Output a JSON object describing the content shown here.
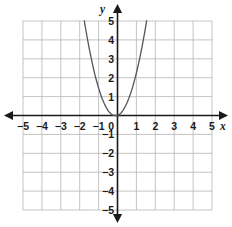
{
  "chart_data": {
    "type": "line",
    "title": "",
    "subtitle": "",
    "xlabel": "x",
    "ylabel": "y",
    "xlim": [
      -5,
      5
    ],
    "ylim": [
      -5,
      5
    ],
    "grid": true,
    "legend": "none",
    "x_ticks": [
      "-5",
      "-4",
      "-3",
      "-2",
      "-1",
      "0",
      "1",
      "2",
      "3",
      "4",
      "5"
    ],
    "x_tick_values": [
      -5,
      -4,
      -3,
      -2,
      -1,
      0,
      1,
      2,
      3,
      4,
      5
    ],
    "y_ticks": [
      "5",
      "4",
      "3",
      "2",
      "1",
      "0",
      "-1",
      "-2",
      "-3",
      "-4",
      "-5"
    ],
    "y_tick_values": [
      5,
      4,
      3,
      2,
      1,
      0,
      -1,
      -2,
      -3,
      -4,
      -5
    ],
    "origin_label": "0",
    "curve_color": "#555555",
    "grid_color": "#b5b5b5",
    "axis_color": "#1a1a1a",
    "series": [
      {
        "name": "parabola",
        "equation": "y = 1.85x^2 + 0.4x",
        "vertex": [
          0,
          0
        ],
        "x": [
          -1.7,
          -1.6,
          -1.5,
          -1.4,
          -1.3,
          -1.2,
          -1.1,
          -1.0,
          -0.9,
          -0.8,
          -0.7,
          -0.6,
          -0.5,
          -0.4,
          -0.3,
          -0.2,
          -0.1,
          0.0,
          0.1,
          0.2,
          0.3,
          0.4,
          0.5,
          0.6,
          0.7,
          0.8,
          0.9,
          1.0,
          1.1,
          1.2,
          1.3,
          1.4,
          1.5,
          1.6,
          1.7,
          1.8,
          1.9,
          2.0,
          2.1,
          2.15
        ],
        "y": [
          4.67,
          4.1,
          3.56,
          3.07,
          2.61,
          2.18,
          1.8,
          1.45,
          1.14,
          0.86,
          0.63,
          0.43,
          0.26,
          0.14,
          0.05,
          0.01,
          0.0,
          0.0,
          0.06,
          0.15,
          0.29,
          0.46,
          0.66,
          0.91,
          1.19,
          1.5,
          1.86,
          2.25,
          2.68,
          3.14,
          3.65,
          4.19,
          4.76,
          5.38,
          6.03,
          6.71,
          7.44,
          8.2,
          9.0,
          9.41
        ]
      }
    ]
  },
  "axes": {
    "x_axis_label": "x",
    "y_axis_label": "y"
  }
}
